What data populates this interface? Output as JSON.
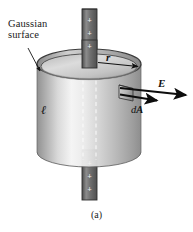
{
  "figure": {
    "caption": "(a)",
    "title_label": "Gaussian\nsurface",
    "labels": {
      "gaussian_surface": "Gaussian\nsurface",
      "radius": "r",
      "length": "ℓ",
      "efield": "E",
      "area_element_d": "d",
      "area_element_A": "A"
    },
    "charge_symbol": "+",
    "top_rod_charges": [
      "+",
      "+",
      "+"
    ],
    "bottom_rod_charges": [
      "+",
      "+",
      "+"
    ],
    "colors": {
      "background": "#ffffff",
      "ink": "#111111",
      "cylinder_light": "#f2f2f2",
      "cylinder_mid": "#c9c9c9",
      "cylinder_dark": "#8f8f8f",
      "top_face_light": "#e6e6e6",
      "top_face_dark": "#9a9a9a",
      "rod_fill": "#6e6e6e",
      "rod_edge": "#3a3a3a",
      "arrow": "#0d0d0d",
      "outline": "#2b2b2b",
      "dashed": "#ffffff"
    },
    "geometry": {
      "cylinder_cx": 89,
      "cylinder_rx": 52,
      "top_cy": 64,
      "bottom_cy": 152,
      "ellipse_ry": 15,
      "rod_x": 82,
      "rod_w": 15,
      "patch_x": 118,
      "patch_y": 86
    }
  }
}
